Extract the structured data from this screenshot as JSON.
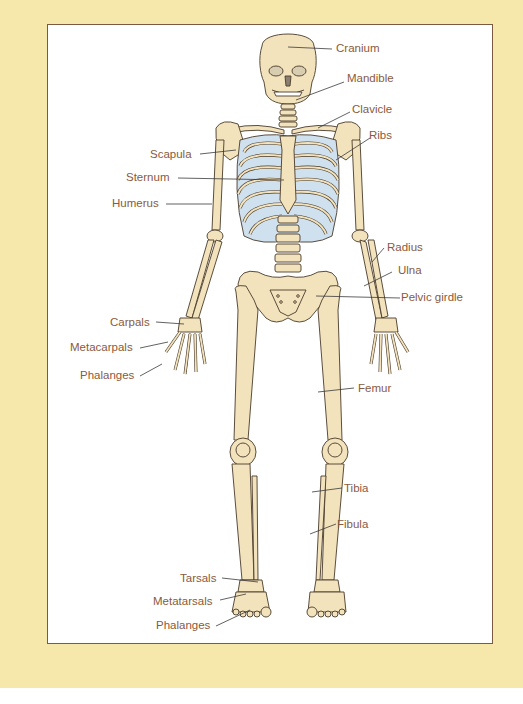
{
  "colors": {
    "page_background": "#f6e7aa",
    "frame_border": "#7a5a40",
    "bone_fill": "#f2e3bd",
    "bone_stroke": "#4a3a2a",
    "cartilage": "#cfe0ee",
    "label_text": "#8a5a3c",
    "leader_line": "#3a3a3a"
  },
  "diagram": {
    "labels": {
      "cranium": "Cranium",
      "mandible": "Mandible",
      "clavicle": "Clavicle",
      "ribs": "Ribs",
      "scapula": "Scapula",
      "sternum": "Sternum",
      "humerus": "Humerus",
      "radius": "Radius",
      "ulna": "Ulna",
      "pelvic_girdle": "Pelvic girdle",
      "carpals": "Carpals",
      "metacarpals": "Metacarpals",
      "phalanges_hand": "Phalanges",
      "femur": "Femur",
      "tibia": "Tibia",
      "fibula": "Fibula",
      "tarsals": "Tarsals",
      "metatarsals": "Metatarsals",
      "phalanges_foot": "Phalanges"
    }
  }
}
